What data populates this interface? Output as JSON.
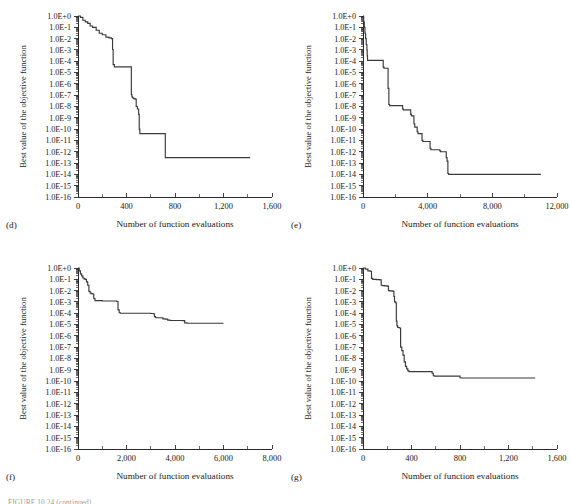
{
  "figure": {
    "caption_partial": "FIGURE 10.24 (continued)",
    "axis_label_y": "Best value of the objective function",
    "axis_label_x": "Number of function evaluations",
    "y_tick_labels": [
      "1.0E+0",
      "1.0E-1",
      "1.0E-2",
      "1.0E-3",
      "1.0E-4",
      "1.0E-5",
      "1.0E-6",
      "1.0E-7",
      "1.0E-8",
      "1.0E-9",
      "1.0E-10",
      "1.0E-11",
      "1.0E-12",
      "1.0E-13",
      "1.0E-14",
      "1.0E-15",
      "1.0E-16"
    ],
    "curve_color": "#3a3a3a",
    "axis_color": "#2b2b2b"
  },
  "chart_data": [
    {
      "type": "line",
      "panel": "(d)",
      "title": "",
      "xlabel": "Number of function evaluations",
      "ylabel": "Best value of the objective function",
      "xlim": [
        0,
        1600
      ],
      "ylim": [
        1e-16,
        1
      ],
      "yscale": "log",
      "xticks": [
        0,
        400,
        800,
        1200,
        1600
      ],
      "xtick_labels": [
        "0",
        "400",
        "800",
        "1,200",
        "1,600"
      ],
      "grid": false,
      "legend": "none",
      "x": [
        0,
        20,
        40,
        60,
        80,
        100,
        120,
        150,
        175,
        200,
        230,
        255,
        275,
        285,
        290,
        300,
        330,
        370,
        400,
        430,
        440,
        445,
        450,
        455,
        460,
        470,
        480,
        490,
        500,
        505,
        510,
        520,
        600,
        700,
        715,
        720,
        730,
        900,
        1100,
        1300,
        1420
      ],
      "y": [
        1.0,
        0.75,
        0.42,
        0.3,
        0.22,
        0.13,
        0.1,
        0.055,
        0.03,
        0.022,
        0.0135,
        0.0115,
        0.01,
        0.0011,
        5e-05,
        3.2e-05,
        3.2e-05,
        3.2e-05,
        3.2e-05,
        3.2e-05,
        1.1e-07,
        7e-08,
        6e-08,
        5.5e-08,
        5e-08,
        4.5e-08,
        1e-08,
        6e-09,
        2e-09,
        1e-10,
        4e-11,
        4e-11,
        4e-11,
        4e-11,
        4e-11,
        3e-13,
        3e-13,
        3e-13,
        3e-13,
        3e-13,
        3e-13
      ]
    },
    {
      "type": "line",
      "panel": "(e)",
      "title": "",
      "xlabel": "Number of function evaluations",
      "ylabel": "Best value of the objective function",
      "xlim": [
        0,
        12000
      ],
      "ylim": [
        1e-16,
        1
      ],
      "yscale": "log",
      "xticks": [
        0,
        4000,
        8000,
        12000
      ],
      "xtick_labels": [
        "0",
        "4,000",
        "8,000",
        "12,000"
      ],
      "grid": false,
      "legend": "none",
      "x": [
        0,
        40,
        80,
        120,
        160,
        200,
        240,
        260,
        280,
        1200,
        1250,
        1300,
        1500,
        1550,
        1600,
        1650,
        2400,
        2450,
        2500,
        2900,
        2950,
        3000,
        3100,
        3150,
        3200,
        3300,
        3350,
        3400,
        3600,
        3650,
        3700,
        4100,
        4150,
        4200,
        4700,
        4750,
        4800,
        5100,
        5150,
        5200,
        5250,
        5300,
        5350,
        5400,
        6000,
        7000,
        8000,
        9000,
        10000,
        11000
      ],
      "y": [
        1.0,
        0.3,
        0.1,
        0.03,
        0.01,
        0.003,
        0.001,
        0.0003,
        0.00012,
        0.00012,
        3e-05,
        2.4e-05,
        2.4e-05,
        4e-07,
        1.5e-08,
        1.2e-08,
        1.2e-08,
        6e-09,
        5e-09,
        5e-09,
        2e-09,
        1.5e-09,
        1.5e-09,
        3e-10,
        1.5e-10,
        1.5e-10,
        6e-11,
        4e-11,
        4e-11,
        1e-11,
        8e-12,
        8e-12,
        2e-12,
        1.5e-12,
        1.5e-12,
        1.2e-12,
        1e-12,
        1e-12,
        3e-13,
        1.5e-13,
        1.2e-14,
        1e-14,
        1e-14,
        1e-14,
        1e-14,
        1e-14,
        1e-14,
        1e-14,
        1e-14,
        1e-14
      ]
    },
    {
      "type": "line",
      "panel": "(f)",
      "title": "",
      "xlabel": "Number of function evaluations",
      "ylabel": "Best value of the objective function",
      "xlim": [
        0,
        8000
      ],
      "ylim": [
        1e-16,
        1
      ],
      "yscale": "log",
      "xticks": [
        0,
        2000,
        4000,
        6000,
        8000
      ],
      "xtick_labels": [
        "0",
        "2,000",
        "4,000",
        "6,000",
        "8,000"
      ],
      "grid": false,
      "legend": "none",
      "x": [
        0,
        50,
        100,
        150,
        200,
        250,
        300,
        350,
        400,
        450,
        500,
        550,
        600,
        650,
        700,
        900,
        1000,
        1100,
        1500,
        1600,
        1650,
        1700,
        1750,
        2400,
        2800,
        3000,
        3100,
        3150,
        3200,
        3400,
        3500,
        3600,
        3700,
        3800,
        4200,
        4300,
        4400,
        4500,
        5000,
        5500,
        6000
      ],
      "y": [
        1.0,
        0.55,
        0.3,
        0.2,
        0.13,
        0.11,
        0.1,
        0.06,
        0.03,
        0.0085,
        0.006,
        0.0055,
        0.005,
        0.002,
        0.0013,
        0.0013,
        0.0012,
        0.0012,
        0.0012,
        0.0011,
        0.0002,
        0.00011,
        0.0001,
        0.0001,
        0.0001,
        9.5e-05,
        9e-05,
        5e-05,
        4e-05,
        4e-05,
        3.2e-05,
        3e-05,
        2.5e-05,
        2.3e-05,
        2.3e-05,
        2.2e-05,
        1.4e-05,
        1.3e-05,
        1.3e-05,
        1.3e-05,
        1.3e-05
      ]
    },
    {
      "type": "line",
      "panel": "(g)",
      "title": "",
      "xlabel": "Number of function evaluations",
      "ylabel": "Best value of the objective function",
      "xlim": [
        0,
        1600
      ],
      "ylim": [
        1e-16,
        1
      ],
      "yscale": "log",
      "xticks": [
        0,
        400,
        800,
        1200,
        1600
      ],
      "xtick_labels": [
        "0",
        "400",
        "800",
        "1,200",
        "1,600"
      ],
      "grid": false,
      "legend": "none",
      "x": [
        0,
        20,
        40,
        60,
        70,
        80,
        110,
        140,
        150,
        160,
        180,
        200,
        210,
        220,
        240,
        250,
        255,
        260,
        270,
        275,
        280,
        285,
        290,
        300,
        310,
        320,
        330,
        340,
        350,
        360,
        370,
        380,
        400,
        500,
        560,
        570,
        580,
        590,
        600,
        700,
        790,
        800,
        810,
        900,
        1000,
        1200,
        1400,
        1420
      ],
      "y": [
        1.0,
        0.8,
        0.55,
        0.52,
        0.12,
        0.1,
        0.095,
        0.09,
        0.03,
        0.028,
        0.026,
        0.025,
        0.01,
        0.0095,
        0.009,
        0.0085,
        0.003,
        0.001,
        0.0008,
        2e-05,
        8e-06,
        6e-06,
        5.5e-06,
        5e-06,
        1e-07,
        5e-08,
        2e-08,
        5e-09,
        2e-09,
        1.2e-09,
        8e-10,
        7e-10,
        7e-10,
        7e-10,
        7e-10,
        5e-10,
        3e-10,
        2.8e-10,
        2.8e-10,
        2.8e-10,
        2.8e-10,
        2e-10,
        1.9e-10,
        1.9e-10,
        1.9e-10,
        1.9e-10,
        1.9e-10,
        1.9e-10
      ]
    }
  ]
}
